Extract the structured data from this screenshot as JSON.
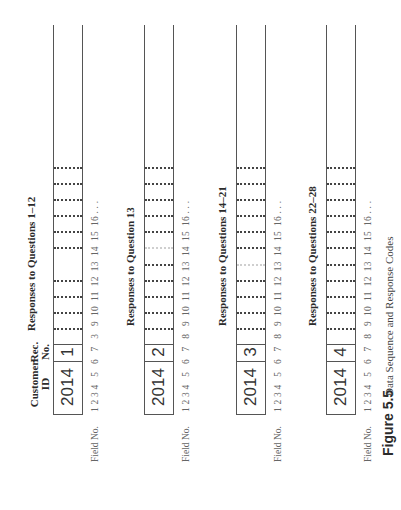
{
  "figure": {
    "number_label": "Figure 5.5",
    "caption": "Data Sequence and Response Codes"
  },
  "headers": {
    "customer_id": [
      "Customer",
      "ID"
    ],
    "rec_no": [
      "Rec.",
      "No."
    ]
  },
  "field_no_label": "Field No.",
  "records": [
    {
      "customer_id": "2014",
      "rec_no": "1",
      "responses_label": "Responses to Questions 1–12",
      "field_labels": "1 2 3 4   5   6   7   3   9  10  11  12  13  14  15  16 . . .",
      "merged_gap": "10-11"
    },
    {
      "customer_id": "2014",
      "rec_no": "2",
      "responses_label": "Responses to Question 13",
      "field_labels": "1 2 3 4   5   6   7   8   9  10  11  12  13  14  15  16 . . .",
      "merged_gap": "11-12"
    },
    {
      "customer_id": "2014",
      "rec_no": "3",
      "responses_label": "Responses to Questions 14–21",
      "field_labels": "1 2 3 4   5   6   7   8   9  10  11  12  13  14  15  16 . . .",
      "merged_gap": "10-11"
    },
    {
      "customer_id": "2014",
      "rec_no": "4",
      "responses_label": "Responses to Questions 22–28",
      "field_labels": "1 2 3 4   5   6   7   8   9  10  11  12  13  14  15  16 . . .",
      "merged_gap": ""
    }
  ],
  "colors": {
    "line": "#555555",
    "text": "#2b2b2b",
    "field_text": "#666666"
  }
}
